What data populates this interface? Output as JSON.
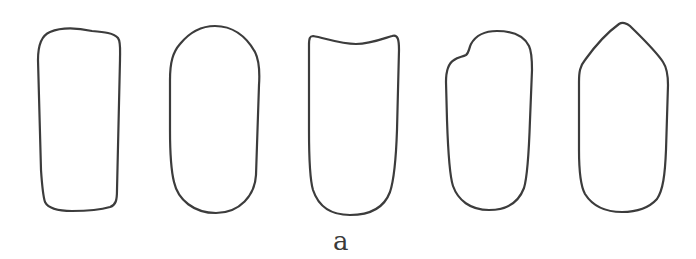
{
  "figure": {
    "caption_label": "a",
    "stroke_color": "#3c3c3c",
    "background_color": "#ffffff",
    "shapes": [
      {
        "name": "rounded-rectangle-slightly-tapered",
        "index": 1
      },
      {
        "name": "elongated-oval-capsule",
        "index": 2
      },
      {
        "name": "rectangle-with-concave-top",
        "index": 3
      },
      {
        "name": "rounded-shape-with-top-left-notch",
        "index": 4
      },
      {
        "name": "pointed-top-elongated-shape",
        "index": 5
      }
    ]
  }
}
